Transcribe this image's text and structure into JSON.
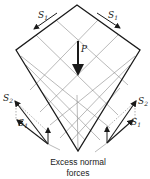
{
  "figure": {
    "type": "kite-shaped membrane shell under point load",
    "labels": {
      "shear_top_left": {
        "main": "S",
        "sub": "1"
      },
      "shear_top_right": {
        "main": "S",
        "sub": "1"
      },
      "load": "P",
      "left_s2": {
        "main": "S",
        "sub": "2"
      },
      "left_s1": {
        "main": "S",
        "sub": "1"
      },
      "right_s2": {
        "main": "S",
        "sub": "2"
      },
      "right_s1": {
        "main": "S",
        "sub": "1"
      }
    },
    "caption_line1": "Excess normal",
    "caption_line2": "forces",
    "colors": {
      "outline": "#1a1a1a",
      "grid": "#8a8a8a",
      "dashed": "#777777"
    }
  }
}
